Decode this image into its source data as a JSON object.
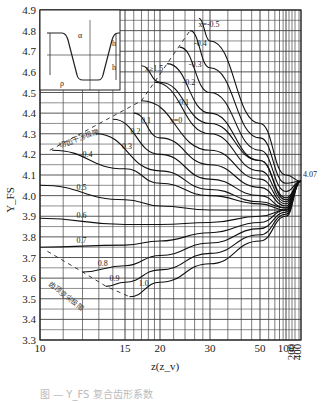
{
  "chart_data": {
    "type": "line",
    "title": "",
    "xlabel": "z(z_v)",
    "ylabel": "Y_FS",
    "x_scale": "reciprocal-like (compressed toward large z)",
    "xlim": [
      10,
      400
    ],
    "ylim": [
      3.3,
      4.9
    ],
    "x_ticks": [
      "10",
      "15",
      "20",
      "30",
      "50",
      "100",
      "200",
      "400"
    ],
    "y_ticks": [
      "3.3",
      "3.4",
      "3.5",
      "3.6",
      "3.7",
      "3.8",
      "3.9",
      "4.0",
      "4.1",
      "4.2",
      "4.3",
      "4.4",
      "4.5",
      "4.6",
      "4.7",
      "4.8",
      "4.9"
    ],
    "convergence_annotation": "4.07",
    "limit_lines": [
      {
        "name": "切齿干涉极限",
        "style": "dashed"
      },
      {
        "name": "齿顶变尖极限",
        "style": "dashed"
      }
    ],
    "inset_labels": [
      "α_n",
      "ρ_f",
      "h_a0",
      "h_f0"
    ],
    "series": [
      {
        "name": "x≥1.5",
        "x": [
          17,
          20,
          30,
          50,
          100,
          400
        ],
        "values": [
          4.63,
          4.55,
          4.35,
          4.17,
          3.98,
          4.07
        ]
      },
      {
        "name": "x=-0.5",
        "x": [
          27,
          30,
          50,
          100,
          400
        ],
        "values": [
          4.86,
          4.75,
          4.35,
          4.1,
          4.07
        ]
      },
      {
        "name": "-0.4",
        "x": [
          25,
          30,
          50,
          100,
          400
        ],
        "values": [
          4.8,
          4.62,
          4.28,
          4.06,
          4.07
        ]
      },
      {
        "name": "-0.3",
        "x": [
          23,
          30,
          50,
          100,
          400
        ],
        "values": [
          4.72,
          4.5,
          4.22,
          4.02,
          4.07
        ]
      },
      {
        "name": "-0.2",
        "x": [
          21,
          30,
          50,
          100,
          400
        ],
        "values": [
          4.64,
          4.4,
          4.17,
          3.99,
          4.07
        ]
      },
      {
        "name": "-0.1",
        "x": [
          19,
          30,
          50,
          100,
          400
        ],
        "values": [
          4.55,
          4.3,
          4.12,
          3.97,
          4.07
        ]
      },
      {
        "name": "x=0",
        "x": [
          17,
          30,
          50,
          100,
          400
        ],
        "values": [
          4.46,
          4.22,
          4.08,
          3.96,
          4.07
        ]
      },
      {
        "name": "0.1",
        "x": [
          16,
          20,
          30,
          50,
          100,
          400
        ],
        "values": [
          4.4,
          4.28,
          4.15,
          4.04,
          3.95,
          4.07
        ]
      },
      {
        "name": "0.2",
        "x": [
          14,
          20,
          30,
          50,
          100,
          400
        ],
        "values": [
          4.37,
          4.2,
          4.08,
          4.0,
          3.94,
          4.07
        ]
      },
      {
        "name": "0.3",
        "x": [
          12.8,
          20,
          30,
          50,
          100,
          400
        ],
        "values": [
          4.3,
          4.12,
          4.03,
          3.97,
          3.94,
          4.07
        ]
      },
      {
        "name": "0.4",
        "x": [
          10.5,
          15,
          20,
          30,
          50,
          100,
          400
        ],
        "values": [
          4.22,
          4.13,
          4.06,
          4.0,
          3.96,
          3.93,
          4.07
        ]
      },
      {
        "name": "0.5",
        "x": [
          10,
          15,
          20,
          30,
          50,
          100,
          400
        ],
        "values": [
          4.05,
          3.98,
          3.95,
          3.93,
          3.93,
          3.93,
          4.07
        ]
      },
      {
        "name": "0.6",
        "x": [
          10,
          15,
          20,
          30,
          50,
          100,
          400
        ],
        "values": [
          3.89,
          3.86,
          3.86,
          3.87,
          3.9,
          3.93,
          4.07
        ]
      },
      {
        "name": "0.7",
        "x": [
          10,
          15,
          20,
          30,
          50,
          100,
          400
        ],
        "values": [
          3.75,
          3.76,
          3.78,
          3.82,
          3.87,
          3.93,
          4.07
        ]
      },
      {
        "name": "0.8",
        "x": [
          12,
          15,
          20,
          30,
          50,
          100,
          400
        ],
        "values": [
          3.63,
          3.66,
          3.71,
          3.77,
          3.84,
          3.92,
          4.07
        ]
      },
      {
        "name": "0.9",
        "x": [
          13.5,
          15,
          20,
          30,
          50,
          100,
          400
        ],
        "values": [
          3.56,
          3.58,
          3.64,
          3.72,
          3.81,
          3.91,
          4.07
        ]
      },
      {
        "name": "1.0",
        "x": [
          15.5,
          20,
          30,
          50,
          100,
          400
        ],
        "values": [
          3.51,
          3.58,
          3.67,
          3.78,
          3.9,
          4.07
        ]
      }
    ],
    "grid": true,
    "legend_position": "inline labels on curves"
  },
  "caption": "图 — Y_FS 复合齿形系数"
}
